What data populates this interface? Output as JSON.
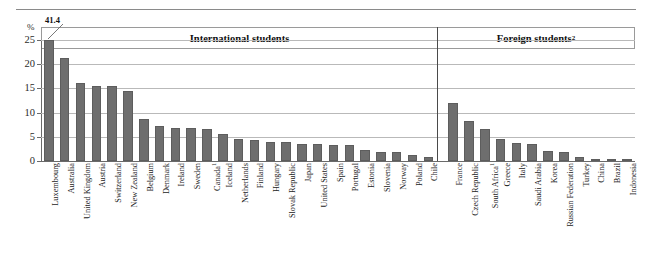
{
  "chart_data": {
    "type": "bar",
    "title": "",
    "xlabel": "",
    "ylabel": "%",
    "ylim": [
      0,
      25
    ],
    "yticks": [
      0,
      5,
      10,
      15,
      20,
      25
    ],
    "grid": true,
    "legend": "none",
    "axis_unit_label": "%",
    "annotations": [
      {
        "text": "41.4",
        "target_category": "Luxembourg",
        "note": "value exceeds axis maximum; bar is clipped at 25"
      }
    ],
    "groups": [
      {
        "name": "International students",
        "label": "International students",
        "categories": [
          "Luxembourg",
          "Australia",
          "United Kingdom",
          "Austria",
          "Switzerland",
          "New Zealand",
          "Belgium",
          "Denmark",
          "Ireland",
          "Sweden",
          "Canada¹",
          "Iceland",
          "Netherlands",
          "Finland",
          "Hungary",
          "Slovak Republic",
          "Japan",
          "United States",
          "Spain",
          "Portugal",
          "Estonia",
          "Slovenia",
          "Norway",
          "Poland",
          "Chile"
        ],
        "values": [
          41.4,
          21.3,
          16.2,
          15.5,
          15.4,
          14.5,
          8.7,
          7.2,
          6.9,
          6.8,
          6.6,
          5.6,
          4.5,
          4.4,
          4.0,
          3.9,
          3.6,
          3.5,
          3.4,
          3.3,
          2.2,
          1.9,
          1.8,
          1.2,
          0.8
        ]
      },
      {
        "name": "Foreign students",
        "label": "Foreign students",
        "label_superscript": "2",
        "categories": [
          "France",
          "Czech Republic",
          "South Africa¹",
          "Greece",
          "Italy",
          "Saudi Arabia",
          "Korea",
          "Russian Federation",
          "Turkey",
          "China",
          "Brazil",
          "Indonesia"
        ],
        "values": [
          11.9,
          8.2,
          6.7,
          4.6,
          3.8,
          3.5,
          2.0,
          1.9,
          0.9,
          0.3,
          0.2,
          0.1
        ]
      }
    ],
    "colors": {
      "bar": "#6e6e6e",
      "gridline": "#b9b9b9",
      "axis": "#6a6a6a",
      "text": "#1a1a1a"
    }
  },
  "headers": {
    "international": "International students",
    "foreign": "Foreign students",
    "foreign_superscript": "2"
  },
  "axis": {
    "unit": "%",
    "ticks": [
      "25",
      "20",
      "15",
      "10",
      "5",
      "0"
    ]
  },
  "callout": {
    "value": "41.4"
  }
}
